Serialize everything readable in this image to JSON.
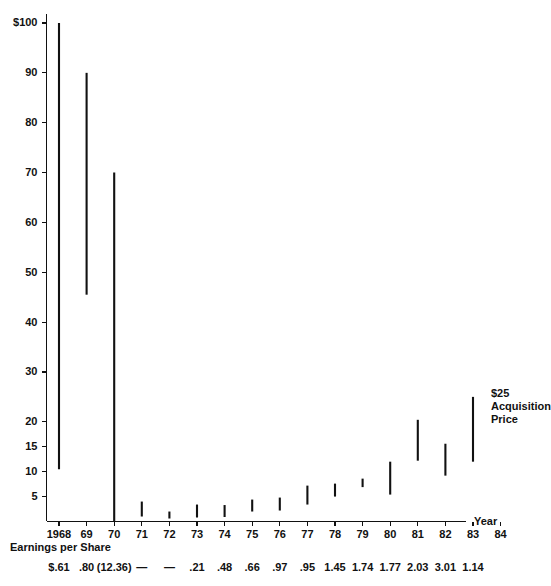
{
  "chart_data": {
    "type": "bar",
    "title": "",
    "subtitle": "",
    "xlabel": "Year",
    "ylabel": "",
    "ylim": [
      0,
      100
    ],
    "grid": false,
    "legend": null,
    "note": "High-low price range bars per year; vertical line spans yearly low to yearly high stock price in dollars.",
    "categories": [
      "1968",
      "69",
      "70",
      "71",
      "72",
      "73",
      "74",
      "75",
      "76",
      "77",
      "78",
      "79",
      "80",
      "81",
      "82",
      "83",
      "84"
    ],
    "y_ticks": [
      {
        "label": "$100",
        "value": 100
      },
      {
        "label": "90",
        "value": 90
      },
      {
        "label": "80",
        "value": 80
      },
      {
        "label": "70",
        "value": 70
      },
      {
        "label": "60",
        "value": 60
      },
      {
        "label": "50",
        "value": 50
      },
      {
        "label": "40",
        "value": 40
      },
      {
        "label": "30",
        "value": 30
      },
      {
        "label": "20",
        "value": 20
      },
      {
        "label": "15",
        "value": 15
      },
      {
        "label": "10",
        "value": 10
      },
      {
        "label": "5",
        "value": 5
      }
    ],
    "series": [
      {
        "name": "Price range (high-low)",
        "bars": [
          {
            "category": "1968",
            "high": 100.0,
            "low": 10.5
          },
          {
            "category": "69",
            "high": 90.0,
            "low": 45.5
          },
          {
            "category": "70",
            "high": 70.0,
            "low": 0.0
          },
          {
            "category": "71",
            "high": 4.0,
            "low": 1.0
          },
          {
            "category": "72",
            "high": 2.0,
            "low": 0.6
          },
          {
            "category": "73",
            "high": 3.4,
            "low": 0.8
          },
          {
            "category": "74",
            "high": 3.3,
            "low": 0.9
          },
          {
            "category": "75",
            "high": 4.4,
            "low": 2.0
          },
          {
            "category": "76",
            "high": 4.8,
            "low": 2.2
          },
          {
            "category": "77",
            "high": 7.2,
            "low": 3.4
          },
          {
            "category": "78",
            "high": 7.6,
            "low": 5.0
          },
          {
            "category": "79",
            "high": 8.6,
            "low": 6.9
          },
          {
            "category": "80",
            "high": 12.0,
            "low": 5.4
          },
          {
            "category": "81",
            "high": 20.4,
            "low": 12.2
          },
          {
            "category": "82",
            "high": 15.6,
            "low": 9.2
          },
          {
            "category": "83",
            "high": 25.0,
            "low": 12.0
          },
          {
            "category": "84",
            "high": null,
            "low": null
          }
        ]
      }
    ],
    "eps_row": {
      "title": "Earnings per Share",
      "values": [
        {
          "category": "1968",
          "text": "$.61"
        },
        {
          "category": "69",
          "text": ".80"
        },
        {
          "category": "70",
          "text": "(12.36)"
        },
        {
          "category": "71",
          "text": "—"
        },
        {
          "category": "72",
          "text": "—"
        },
        {
          "category": "73",
          "text": ".21"
        },
        {
          "category": "74",
          "text": ".48"
        },
        {
          "category": "75",
          "text": ".66"
        },
        {
          "category": "76",
          "text": ".97"
        },
        {
          "category": "77",
          "text": ".95"
        },
        {
          "category": "78",
          "text": "1.45"
        },
        {
          "category": "79",
          "text": "1.74"
        },
        {
          "category": "80",
          "text": "1.77"
        },
        {
          "category": "81",
          "text": "2.03"
        },
        {
          "category": "82",
          "text": "3.01"
        },
        {
          "category": "83",
          "text": "1.14"
        }
      ]
    },
    "annotations": [
      {
        "id": "acquisition",
        "lines": [
          "$25",
          "Acquisition",
          "Price"
        ],
        "at_category": "83"
      }
    ],
    "colors": {
      "line": "#111111",
      "axis": "#111111",
      "background": "#ffffff"
    }
  }
}
